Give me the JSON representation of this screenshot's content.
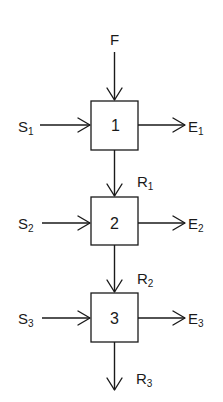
{
  "diagram": {
    "type": "flow-block-diagram",
    "colors": {
      "stroke": "#1a1a1a",
      "background": "#ffffff"
    },
    "feed": {
      "label": "F"
    },
    "stages": [
      {
        "number": "1",
        "input": {
          "main": "S",
          "sub": "1"
        },
        "output": {
          "main": "E",
          "sub": "1"
        },
        "residue": {
          "main": "R",
          "sub": "1"
        }
      },
      {
        "number": "2",
        "input": {
          "main": "S",
          "sub": "2"
        },
        "output": {
          "main": "E",
          "sub": "2"
        },
        "residue": {
          "main": "R",
          "sub": "2"
        }
      },
      {
        "number": "3",
        "input": {
          "main": "S",
          "sub": "3"
        },
        "output": {
          "main": "E",
          "sub": "3"
        },
        "residue": {
          "main": "R",
          "sub": "3"
        }
      }
    ],
    "edges": [
      {
        "from": "F",
        "to": "1"
      },
      {
        "from": "S1",
        "to": "1"
      },
      {
        "from": "1",
        "to": "E1"
      },
      {
        "from": "1",
        "to": "2",
        "label": "R1"
      },
      {
        "from": "S2",
        "to": "2"
      },
      {
        "from": "2",
        "to": "E2"
      },
      {
        "from": "2",
        "to": "3",
        "label": "R2"
      },
      {
        "from": "S3",
        "to": "3"
      },
      {
        "from": "3",
        "to": "E3"
      },
      {
        "from": "3",
        "to": "R3"
      }
    ]
  }
}
